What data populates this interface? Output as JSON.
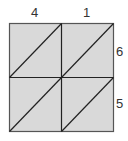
{
  "diagram": {
    "type": "lattice-multiplication-grid",
    "top_digits": [
      "4",
      "1"
    ],
    "right_digits": [
      "6",
      "5"
    ],
    "rows": 2,
    "cols": 2,
    "fill_color": "#d9d9d9",
    "line_color": "#222222"
  }
}
